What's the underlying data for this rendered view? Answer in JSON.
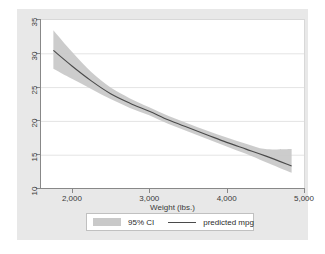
{
  "chart_data": {
    "type": "line",
    "title": "",
    "subtitle": "",
    "xlabel": "Weight (lbs.)",
    "ylabel": "",
    "xlim": [
      1600,
      5000
    ],
    "ylim": [
      10,
      35
    ],
    "xticks": [
      "2,000",
      "3,000",
      "4,000",
      "5,000"
    ],
    "xtick_values": [
      2000,
      3000,
      4000,
      5000
    ],
    "yticks": [
      "10",
      "15",
      "20",
      "25",
      "30",
      "35"
    ],
    "ytick_values": [
      10,
      15,
      20,
      25,
      30,
      35
    ],
    "grid": "horizontal",
    "legend_position": "bottom",
    "legend": [
      {
        "label": "95% CI",
        "marker": "band",
        "color": "#c9c9c9"
      },
      {
        "label": "predicted mpg",
        "marker": "line",
        "color": "#4a4a4a"
      }
    ],
    "x": [
      1760,
      2000,
      2250,
      2500,
      2750,
      3000,
      3250,
      3500,
      3750,
      4000,
      4250,
      4500,
      4840
    ],
    "series": [
      {
        "name": "predicted mpg",
        "values": [
          30.5,
          28.2,
          26.0,
          24.1,
          22.7,
          21.5,
          20.2,
          19.1,
          18.0,
          16.9,
          15.9,
          14.9,
          13.4
        ]
      },
      {
        "name": "95% CI upper",
        "values": [
          33.5,
          30.3,
          27.3,
          25.0,
          23.4,
          22.1,
          20.8,
          19.7,
          18.6,
          17.6,
          16.7,
          15.9,
          15.9
        ]
      },
      {
        "name": "95% CI lower",
        "values": [
          27.8,
          26.3,
          24.8,
          23.3,
          22.0,
          20.9,
          19.6,
          18.5,
          17.4,
          16.3,
          15.2,
          14.0,
          12.4
        ]
      }
    ]
  },
  "legend": {
    "ci_label": "95% CI",
    "line_label": "predicted mpg"
  },
  "axis": {
    "x_title": "Weight (lbs.)"
  },
  "colors": {
    "graph_region": "#e8e8e8",
    "plot_background": "#ffffff",
    "band": "#c9c9c9",
    "line": "#4a4a4a",
    "gridline": "#e4e4e4",
    "axis": "#888888",
    "text": "#3a3a3a"
  }
}
